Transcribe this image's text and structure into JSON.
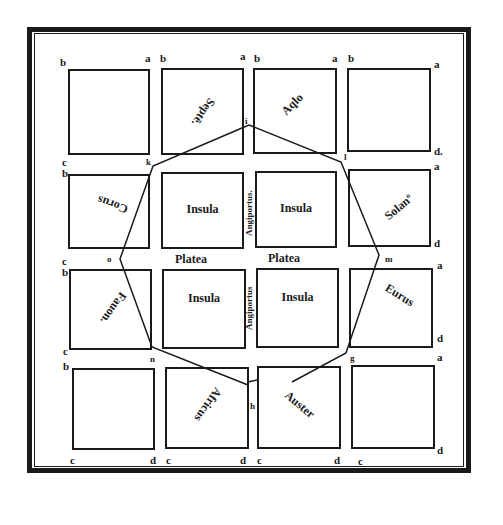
{
  "diagram": {
    "colors": {
      "ink": "#1a1a1a",
      "paper": "#ffffff"
    },
    "blocks": [
      {
        "id": "r1c1",
        "x": 69,
        "y": 70,
        "w": 80,
        "h": 84,
        "label": ""
      },
      {
        "id": "r1c2",
        "x": 162,
        "y": 69,
        "w": 81,
        "h": 85,
        "label": "Septē."
      },
      {
        "id": "r1c3",
        "x": 254,
        "y": 69,
        "w": 82,
        "h": 84,
        "label": "Aqlo"
      },
      {
        "id": "r1c4",
        "x": 348,
        "y": 69,
        "w": 82,
        "h": 82,
        "label": ""
      },
      {
        "id": "r2c1",
        "x": 69,
        "y": 175,
        "w": 80,
        "h": 73,
        "label": "Corus"
      },
      {
        "id": "r2c2",
        "x": 162,
        "y": 173,
        "w": 81,
        "h": 75,
        "label": "Insula"
      },
      {
        "id": "r2c3",
        "x": 256,
        "y": 172,
        "w": 80,
        "h": 75,
        "label": "Insula"
      },
      {
        "id": "r2c4",
        "x": 349,
        "y": 170,
        "w": 81,
        "h": 76,
        "label": "Solanº"
      },
      {
        "id": "r3c1",
        "x": 70,
        "y": 270,
        "w": 81,
        "h": 79,
        "label": "Fauon."
      },
      {
        "id": "r3c2",
        "x": 163,
        "y": 270,
        "w": 82,
        "h": 78,
        "label": "Insula"
      },
      {
        "id": "r3c3",
        "x": 257,
        "y": 269,
        "w": 81,
        "h": 78,
        "label": "Insula"
      },
      {
        "id": "r3c4",
        "x": 350,
        "y": 269,
        "w": 82,
        "h": 78,
        "label": "Eurus"
      },
      {
        "id": "r4c1",
        "x": 73,
        "y": 369,
        "w": 81,
        "h": 80,
        "label": ""
      },
      {
        "id": "r4c2",
        "x": 166,
        "y": 368,
        "w": 82,
        "h": 80,
        "label": "Africus"
      },
      {
        "id": "r4c3",
        "x": 258,
        "y": 367,
        "w": 82,
        "h": 81,
        "label": "Auster"
      },
      {
        "id": "r4c4",
        "x": 352,
        "y": 366,
        "w": 82,
        "h": 82,
        "label": ""
      }
    ],
    "streets": {
      "platea_left": "Platea",
      "platea_right": "Platea",
      "angiportus_top": "Angiportus.",
      "angiportus_bottom": "Angiportus"
    },
    "corner_letters": [
      {
        "t": "b",
        "x": 60,
        "y": 66
      },
      {
        "t": "a",
        "x": 145,
        "y": 62
      },
      {
        "t": "b",
        "x": 160,
        "y": 62
      },
      {
        "t": "a",
        "x": 240,
        "y": 60
      },
      {
        "t": "b",
        "x": 254,
        "y": 62
      },
      {
        "t": "a",
        "x": 332,
        "y": 62
      },
      {
        "t": "b",
        "x": 348,
        "y": 62
      },
      {
        "t": "a",
        "x": 434,
        "y": 68
      },
      {
        "t": "d.",
        "x": 434,
        "y": 155
      },
      {
        "t": "c",
        "x": 62,
        "y": 166
      },
      {
        "t": "b",
        "x": 62,
        "y": 177
      },
      {
        "t": "a",
        "x": 434,
        "y": 170
      },
      {
        "t": "d",
        "x": 434,
        "y": 247
      },
      {
        "t": "c",
        "x": 62,
        "y": 265
      },
      {
        "t": "b",
        "x": 62,
        "y": 276
      },
      {
        "t": "a",
        "x": 437,
        "y": 269
      },
      {
        "t": "d",
        "x": 437,
        "y": 342
      },
      {
        "t": "c",
        "x": 63,
        "y": 355
      },
      {
        "t": "b",
        "x": 63,
        "y": 370
      },
      {
        "t": "a",
        "x": 437,
        "y": 361
      },
      {
        "t": "c",
        "x": 70,
        "y": 464
      },
      {
        "t": "d",
        "x": 150,
        "y": 464
      },
      {
        "t": "c",
        "x": 166,
        "y": 464
      },
      {
        "t": "d",
        "x": 240,
        "y": 464
      },
      {
        "t": "c",
        "x": 257,
        "y": 464
      },
      {
        "t": "d",
        "x": 334,
        "y": 464
      },
      {
        "t": "c",
        "x": 358,
        "y": 465
      },
      {
        "t": "d",
        "x": 437,
        "y": 454
      }
    ],
    "octagon_points": [
      {
        "label": "i",
        "x": 249,
        "y": 125,
        "tx": 245,
        "ty": 124
      },
      {
        "label": "l",
        "x": 341,
        "y": 162,
        "tx": 344,
        "ty": 160
      },
      {
        "label": "m",
        "x": 379,
        "y": 255,
        "tx": 385,
        "ty": 262
      },
      {
        "label": "g",
        "x": 346,
        "y": 353,
        "tx": 350,
        "ty": 361
      },
      {
        "label": "h",
        "x": 257,
        "y": 380,
        "tx": 250,
        "ty": 409
      },
      {
        "label": "n",
        "x": 152,
        "y": 347,
        "tx": 150,
        "ty": 362
      },
      {
        "label": "o",
        "x": 120,
        "y": 259,
        "tx": 107,
        "ty": 262
      },
      {
        "label": "k",
        "x": 153,
        "y": 166,
        "tx": 146,
        "ty": 165
      }
    ]
  }
}
